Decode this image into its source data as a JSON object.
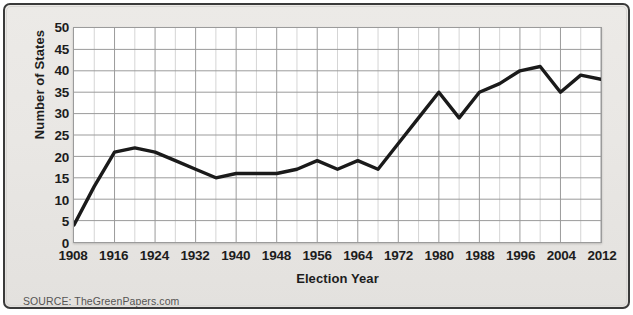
{
  "figure": {
    "source_note": "SOURCE: TheGreenPapers.com",
    "frame_color": "#3a3a3a",
    "panel_color": "#eceae7",
    "plot_background": "#ffffff",
    "line_color": "#1a1a1a",
    "major_gridline_color": "#9a9a9a",
    "minor_gridline_color": "#d5d5d5"
  },
  "chart_data": {
    "type": "line",
    "title": "",
    "xlabel": "Election Year",
    "ylabel": "Number of States",
    "xlim": [
      1908,
      2012
    ],
    "ylim": [
      0,
      50
    ],
    "grid": true,
    "legend": "none",
    "xtick_labels": [
      "1908",
      "1916",
      "1924",
      "1932",
      "1940",
      "1948",
      "1956",
      "1964",
      "1972",
      "1980",
      "1988",
      "1996",
      "2004",
      "2012"
    ],
    "xtick_values": [
      1908,
      1916,
      1924,
      1932,
      1940,
      1948,
      1956,
      1964,
      1972,
      1980,
      1988,
      1996,
      2004,
      2012
    ],
    "ytick_labels": [
      "0",
      "5",
      "10",
      "15",
      "20",
      "25",
      "30",
      "35",
      "40",
      "45",
      "50"
    ],
    "ytick_values": [
      0,
      5,
      10,
      15,
      20,
      25,
      30,
      35,
      40,
      45,
      50
    ],
    "x": [
      1908,
      1912,
      1916,
      1920,
      1924,
      1928,
      1932,
      1936,
      1940,
      1944,
      1948,
      1952,
      1956,
      1960,
      1964,
      1968,
      1972,
      1976,
      1980,
      1984,
      1988,
      1992,
      1996,
      2000,
      2004,
      2008,
      2012
    ],
    "values": [
      4,
      13,
      21,
      22,
      21,
      19,
      17,
      15,
      16,
      16,
      16,
      17,
      19,
      17,
      19,
      17,
      23,
      29,
      35,
      29,
      35,
      37,
      40,
      41,
      35,
      39,
      38
    ],
    "series": [
      {
        "name": "Number of States",
        "x": [
          1908,
          1912,
          1916,
          1920,
          1924,
          1928,
          1932,
          1936,
          1940,
          1944,
          1948,
          1952,
          1956,
          1960,
          1964,
          1968,
          1972,
          1976,
          1980,
          1984,
          1988,
          1992,
          1996,
          2000,
          2004,
          2008,
          2012
        ],
        "values": [
          4,
          13,
          21,
          22,
          21,
          19,
          17,
          15,
          16,
          16,
          16,
          17,
          19,
          17,
          19,
          17,
          23,
          29,
          35,
          29,
          35,
          37,
          40,
          41,
          35,
          39,
          38
        ],
        "color": "#1a1a1a"
      }
    ]
  }
}
